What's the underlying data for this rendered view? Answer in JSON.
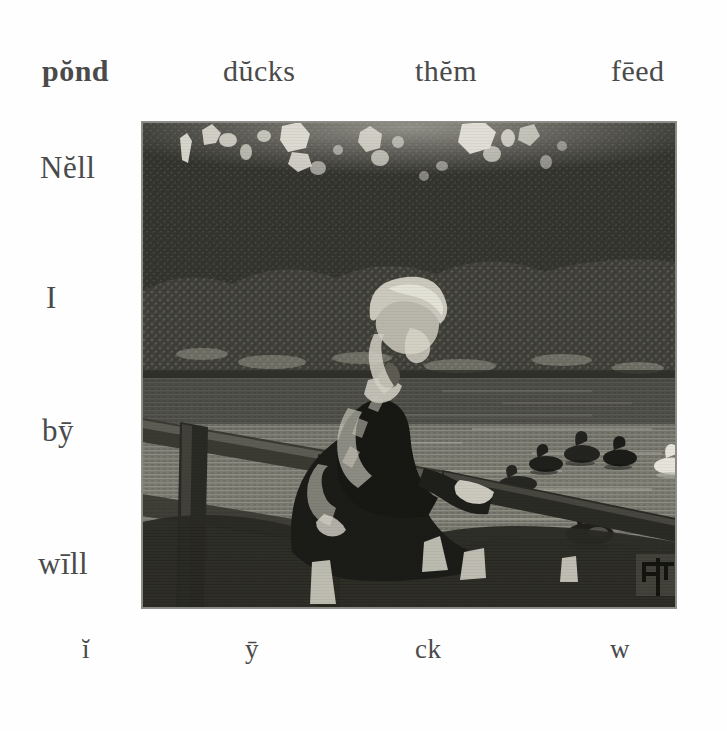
{
  "page": {
    "background_color": "#fefefe",
    "ink_color": "#4a4a4a"
  },
  "top_row": {
    "words": [
      {
        "id": "pond",
        "text": "pŏnd"
      },
      {
        "id": "ducks",
        "text": "dŭcks"
      },
      {
        "id": "them",
        "text": "thĕm"
      },
      {
        "id": "feed",
        "text": "fēed"
      }
    ]
  },
  "left_column": {
    "words": [
      {
        "id": "nell",
        "text": "Nĕll"
      },
      {
        "id": "i",
        "text": "I"
      },
      {
        "id": "by",
        "text": "bȳ"
      },
      {
        "id": "will",
        "text": "wīll"
      }
    ]
  },
  "bottom_row": {
    "words": [
      {
        "id": "bi",
        "text": "ĭ"
      },
      {
        "id": "by2",
        "text": "ȳ"
      },
      {
        "id": "ck",
        "text": "ck"
      },
      {
        "id": "w",
        "text": "w"
      }
    ]
  },
  "illustration": {
    "name": "girl-at-pond-feeding-ducks-engraving",
    "description": "Wood engraving of a girl in a dark dress leaning on a wooden rail fence beside a pond, watching ducks swim on the water, with dense dark trees behind.",
    "signature": "artist-monogram",
    "frame": {
      "left": 142,
      "top": 122,
      "width": 534,
      "height": 486
    },
    "tone": {
      "sky_gap": "#e8e6de",
      "foliage_dark": "#2f2f2c",
      "foliage_mid": "#3d3d38",
      "shrub": "#4d4d46",
      "water_dark": "#56564e",
      "water_light": "#8d8d84",
      "figure_dark": "#232320",
      "highlight": "#dcdad2",
      "rail": "#6a6a60"
    },
    "ducks": [
      {
        "id": "duck-1",
        "color": "dark"
      },
      {
        "id": "duck-2",
        "color": "dark"
      },
      {
        "id": "duck-3",
        "color": "dark"
      },
      {
        "id": "duck-4",
        "color": "dark"
      },
      {
        "id": "duck-5",
        "color": "white"
      },
      {
        "id": "duck-6",
        "color": "dark"
      }
    ]
  }
}
